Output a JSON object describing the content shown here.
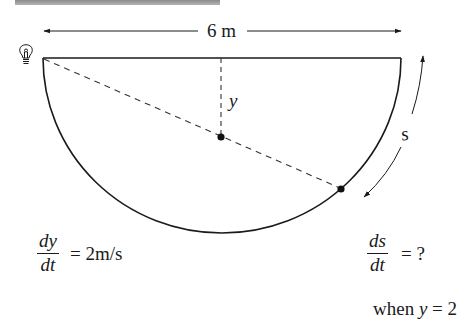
{
  "figure": {
    "width_label": "6 m",
    "depth_variable": "y",
    "arc_variable": "s",
    "light_icon": "lightbulb-icon"
  },
  "equations": {
    "given": {
      "numerator": "dy",
      "denominator": "dt",
      "rhs": "= 2m/s"
    },
    "unknown": {
      "numerator": "ds",
      "denominator": "dt",
      "rhs": "= ?"
    },
    "condition": {
      "prefix": "when ",
      "variable": "y",
      "rhs": " = 2"
    }
  },
  "colors": {
    "ink": "#1a1a1a",
    "header_bar": "#9a9a9a",
    "background": "#ffffff"
  }
}
